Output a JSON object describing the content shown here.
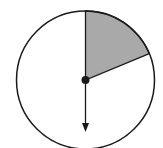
{
  "diagram": {
    "type": "spinner",
    "center": [
      85.5,
      80
    ],
    "radius": 69,
    "shaded_sector": {
      "start_deg": 0,
      "end_deg": 67.5,
      "fill": "#a9a9a9"
    },
    "arrow": {
      "direction_deg": 180,
      "length": 52
    },
    "colors": {
      "stroke": "#1a1a1a",
      "background": "#ffffff",
      "shade": "#a9a9a9"
    }
  }
}
